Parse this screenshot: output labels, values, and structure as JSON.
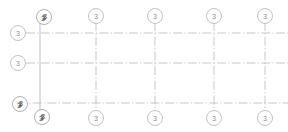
{
  "drawing": {
    "type": "structural-grid-plan",
    "background_color": "#ffffff",
    "line_color": "#b9b9b9",
    "bubble_stroke_color": "#b3b3b3",
    "bubble_text_color": "#8d8d8d",
    "canvas": {
      "width": 288,
      "height": 132
    }
  },
  "gridlines": {
    "vertical": [
      {
        "id": "v1",
        "x": 40,
        "y1": 17,
        "y2": 118,
        "style": "solid"
      },
      {
        "id": "v2",
        "x": 96,
        "y1": 22,
        "y2": 112,
        "style": "center"
      },
      {
        "id": "v3",
        "x": 155,
        "y1": 22,
        "y2": 112,
        "style": "center"
      },
      {
        "id": "v4",
        "x": 214,
        "y1": 22,
        "y2": 112,
        "style": "center"
      },
      {
        "id": "v5",
        "x": 265,
        "y1": 22,
        "y2": 112,
        "style": "center"
      }
    ],
    "horizontal": [
      {
        "id": "h1",
        "y": 33,
        "x1": 26,
        "x2": 288,
        "style": "center"
      },
      {
        "id": "h2",
        "y": 63,
        "x1": 26,
        "x2": 288,
        "style": "center"
      },
      {
        "id": "h3",
        "y": 103,
        "x1": 18,
        "x2": 288,
        "style": "center"
      }
    ]
  },
  "bubbles": {
    "top": [
      {
        "id": "top-1",
        "cx": 44,
        "cy": 17,
        "r": 7.5,
        "label": "3",
        "overlapped": true
      },
      {
        "id": "top-2",
        "cx": 96,
        "cy": 16,
        "r": 7.5,
        "label": "3",
        "overlapped": false
      },
      {
        "id": "top-3",
        "cx": 155,
        "cy": 16,
        "r": 7.5,
        "label": "3",
        "overlapped": false
      },
      {
        "id": "top-4",
        "cx": 214,
        "cy": 16,
        "r": 7.5,
        "label": "3",
        "overlapped": false
      },
      {
        "id": "top-5",
        "cx": 265,
        "cy": 16,
        "r": 7.5,
        "label": "3",
        "overlapped": false
      }
    ],
    "bottom": [
      {
        "id": "bot-1",
        "cx": 42,
        "cy": 117,
        "r": 7.5,
        "label": "3",
        "overlapped": true
      },
      {
        "id": "bot-2",
        "cx": 96,
        "cy": 118,
        "r": 7.5,
        "label": "3",
        "overlapped": false
      },
      {
        "id": "bot-3",
        "cx": 155,
        "cy": 118,
        "r": 7.5,
        "label": "3",
        "overlapped": false
      },
      {
        "id": "bot-4",
        "cx": 214,
        "cy": 118,
        "r": 7.5,
        "label": "3",
        "overlapped": false
      },
      {
        "id": "bot-5",
        "cx": 265,
        "cy": 118,
        "r": 7.5,
        "label": "3",
        "overlapped": false
      }
    ],
    "left": [
      {
        "id": "left-1",
        "cx": 18,
        "cy": 33,
        "r": 7.5,
        "label": "3",
        "overlapped": false
      },
      {
        "id": "left-2",
        "cx": 18,
        "cy": 63,
        "r": 7.5,
        "label": "3",
        "overlapped": false
      },
      {
        "id": "left-3",
        "cx": 20,
        "cy": 104,
        "r": 7.5,
        "label": "3",
        "overlapped": true
      }
    ]
  },
  "labels": {
    "bubble_default": "3"
  }
}
